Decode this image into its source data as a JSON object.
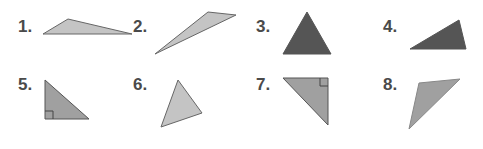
{
  "items": [
    {
      "number": "1.",
      "type": "obtuse triangle",
      "fill": "#c4c4c4"
    },
    {
      "number": "2.",
      "type": "obtuse triangle",
      "fill": "#c4c4c4"
    },
    {
      "number": "3.",
      "type": "acute triangle",
      "fill": "#555555"
    },
    {
      "number": "4.",
      "type": "obtuse triangle",
      "fill": "#555555"
    },
    {
      "number": "5.",
      "type": "right triangle",
      "fill": "#a0a0a0"
    },
    {
      "number": "6.",
      "type": "acute triangle",
      "fill": "#c4c4c4"
    },
    {
      "number": "7.",
      "type": "right triangle",
      "fill": "#a0a0a0"
    },
    {
      "number": "8.",
      "type": "acute triangle",
      "fill": "#a0a0a0"
    }
  ],
  "colors": {
    "label": "#4a4a4a",
    "light": "#c4c4c4",
    "mid": "#a0a0a0",
    "dark": "#555555",
    "stroke": "#666666"
  }
}
